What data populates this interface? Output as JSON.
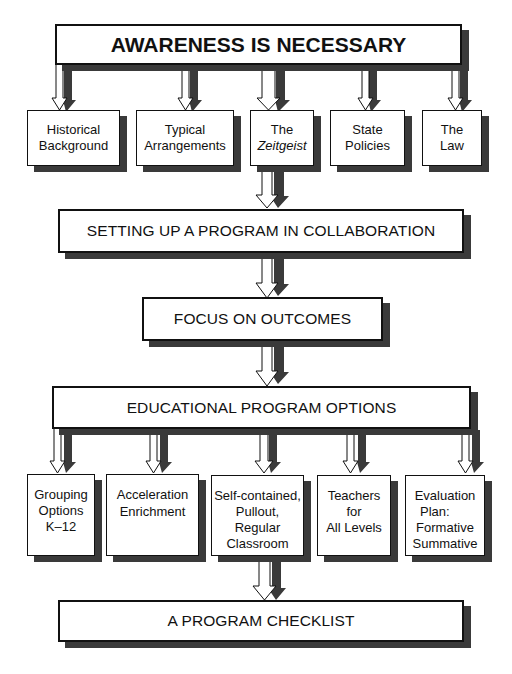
{
  "diagram": {
    "top": {
      "label": "AWARENESS IS NECESSARY"
    },
    "awareness_items": [
      {
        "lines": [
          "Historical",
          "Background"
        ]
      },
      {
        "lines": [
          "Typical",
          "Arrangements"
        ]
      },
      {
        "lines": [
          "The",
          "Zeitgeist"
        ]
      },
      {
        "lines": [
          "State",
          "Policies"
        ]
      },
      {
        "lines": [
          "The",
          "Law"
        ]
      }
    ],
    "setup": {
      "label": "SETTING UP A PROGRAM IN COLLABORATION"
    },
    "focus": {
      "label": "FOCUS ON OUTCOMES"
    },
    "options": {
      "label": "EDUCATIONAL PROGRAM OPTIONS"
    },
    "option_items": [
      {
        "lines": [
          "Grouping",
          "Options",
          "K–12"
        ]
      },
      {
        "lines": [
          "Acceleration",
          "Enrichment"
        ]
      },
      {
        "lines": [
          "Self-contained,",
          "Pullout,",
          "Regular",
          "Classroom"
        ]
      },
      {
        "lines": [
          "Teachers",
          "for",
          "All Levels"
        ]
      },
      {
        "lines": [
          "Evaluation",
          "Plan:",
          "Formative",
          "Summative"
        ]
      }
    ],
    "checklist": {
      "label": "A PROGRAM CHECKLIST"
    },
    "colors": {
      "border": "#111111",
      "shadow": "#3a3a3a",
      "background": "#ffffff"
    }
  }
}
